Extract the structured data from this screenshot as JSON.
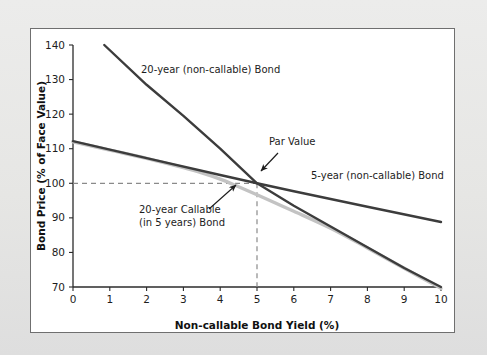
{
  "figure": {
    "background_color": "#e8e8e6",
    "plot_background_color": "#ffffff",
    "frame_color": "#6f6f6f"
  },
  "chart_data": {
    "type": "line",
    "title": "",
    "xlabel": "Non-callable Bond Yield (%)",
    "ylabel": "Bond Price (% of Face Value)",
    "xlim": [
      0,
      10
    ],
    "ylim": [
      70,
      140
    ],
    "xticks": [
      "0",
      "1",
      "2",
      "3",
      "4",
      "5",
      "6",
      "7",
      "8",
      "9",
      "10"
    ],
    "yticks": [
      "70",
      "80",
      "90",
      "100",
      "110",
      "120",
      "130",
      "140"
    ],
    "grid": false,
    "legend_position": "inline-annotations",
    "series": [
      {
        "name": "20-year (non-callable) Bond",
        "color": "#3c3c3c",
        "width": 2.4,
        "x": [
          0.85,
          2,
          3,
          4,
          5,
          6,
          7,
          8,
          9,
          10
        ],
        "values": [
          140,
          128.5,
          119.5,
          110,
          100,
          93.5,
          87.5,
          81.5,
          75.5,
          70
        ]
      },
      {
        "name": "5-year (non-callable) Bond",
        "color": "#3c3c3c",
        "width": 2.4,
        "x": [
          0,
          2,
          4,
          5,
          6,
          8,
          10
        ],
        "values": [
          112.2,
          107.3,
          102.4,
          100,
          97.7,
          93.2,
          88.8
        ]
      },
      {
        "name": "20-year Callable (in 5 years) Bond",
        "color": "#c3c3c3",
        "width": 3.4,
        "x": [
          0,
          1,
          2,
          3,
          3.5,
          4,
          4.5,
          5,
          5.5,
          6,
          7,
          8,
          9,
          10
        ],
        "values": [
          112.0,
          109.6,
          107.2,
          104.5,
          103.0,
          101.2,
          99.0,
          96.7,
          94.3,
          91.9,
          87.0,
          81.3,
          75.4,
          69.6
        ]
      }
    ],
    "reference_lines": [
      {
        "name": "par-value-horizontal",
        "orientation": "horizontal",
        "value": 100,
        "from": 0,
        "to": 5,
        "style": "dashed",
        "color": "#8a8a8a"
      },
      {
        "name": "par-value-vertical",
        "orientation": "vertical",
        "value": 5,
        "from": 70,
        "to": 100,
        "style": "dashed",
        "color": "#8a8a8a"
      }
    ],
    "annotations": [
      {
        "name": "twenty-year-noncallable",
        "text": "20-year (non-callable) Bond",
        "lines": [
          "20-year (non-callable) Bond"
        ],
        "point": [
          2.05,
          134.0
        ],
        "arrow": false
      },
      {
        "name": "par-value",
        "text": "Par Value",
        "lines": [
          "Par Value"
        ],
        "point": [
          5.0,
          100.0
        ],
        "arrow": true
      },
      {
        "name": "five-year-noncallable",
        "text": "5-year (non-callable) Bond",
        "lines": [
          "5-year (non-callable) Bond"
        ],
        "point": [
          6.9,
          98.5
        ],
        "arrow": false
      },
      {
        "name": "twenty-year-callable",
        "text": "20-year Callable (in 5 years) Bond",
        "lines": [
          "20-year Callable",
          "(in 5 years) Bond"
        ],
        "point": [
          4.55,
          98.2
        ],
        "arrow": true
      }
    ]
  }
}
